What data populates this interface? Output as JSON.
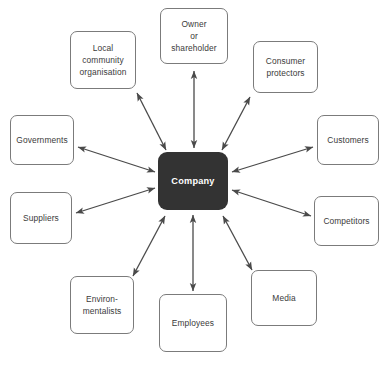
{
  "diagram": {
    "type": "radial-stakeholder-map",
    "hub": {
      "label": "Company",
      "fill": "#333333",
      "text_color": "#ffffff",
      "x": 158,
      "y": 152,
      "width": 70,
      "height": 58
    },
    "node_style": {
      "fill": "#ffffff",
      "border_color": "#7b7b7b",
      "text_color": "#3b3b3b"
    },
    "connector_style": {
      "color": "#4a4a4a",
      "width": 1.3,
      "heads": "both"
    },
    "nodes": [
      {
        "id": "owner",
        "label": "Owner\nor\nshareholder",
        "x": 160,
        "y": 8,
        "width": 68,
        "height": 56,
        "arrow": {
          "x1": 194,
          "y1": 71,
          "x2": 194,
          "y2": 148,
          "heads": "both"
        }
      },
      {
        "id": "local-community-organisation",
        "label": "Local\ncommunity\norganisation",
        "x": 70,
        "y": 31,
        "width": 66,
        "height": 58,
        "arrow": {
          "x1": 137,
          "y1": 93,
          "x2": 166,
          "y2": 150,
          "heads": "both"
        }
      },
      {
        "id": "consumer-protectors",
        "label": "Consumer\nprotectors",
        "x": 253,
        "y": 41,
        "width": 65,
        "height": 52,
        "arrow": {
          "x1": 250,
          "y1": 97,
          "x2": 222,
          "y2": 150,
          "heads": "both"
        }
      },
      {
        "id": "governments",
        "label": "Governments",
        "x": 10,
        "y": 115,
        "width": 64,
        "height": 50,
        "arrow": {
          "x1": 78,
          "y1": 147,
          "x2": 155,
          "y2": 172,
          "heads": "both"
        }
      },
      {
        "id": "customers",
        "label": "Customers",
        "x": 317,
        "y": 115,
        "width": 62,
        "height": 50,
        "arrow": {
          "x1": 313,
          "y1": 147,
          "x2": 232,
          "y2": 172,
          "heads": "both"
        }
      },
      {
        "id": "suppliers",
        "label": "Suppliers",
        "x": 10,
        "y": 192,
        "width": 62,
        "height": 52,
        "arrow": {
          "x1": 76,
          "y1": 213,
          "x2": 155,
          "y2": 188,
          "heads": "both"
        }
      },
      {
        "id": "competitors",
        "label": "Competitors",
        "x": 314,
        "y": 196,
        "width": 65,
        "height": 50,
        "arrow": {
          "x1": 311,
          "y1": 216,
          "x2": 232,
          "y2": 190,
          "heads": "both"
        }
      },
      {
        "id": "environmentalists",
        "label": "Environ-\nmentalists",
        "x": 70,
        "y": 276,
        "width": 64,
        "height": 58,
        "arrow": {
          "x1": 133,
          "y1": 276,
          "x2": 165,
          "y2": 216,
          "heads": "both"
        }
      },
      {
        "id": "employees",
        "label": "Employees",
        "x": 159,
        "y": 294,
        "width": 68,
        "height": 58,
        "arrow": {
          "x1": 193,
          "y1": 291,
          "x2": 193,
          "y2": 215,
          "heads": "both"
        }
      },
      {
        "id": "media",
        "label": "Media",
        "x": 251,
        "y": 270,
        "width": 66,
        "height": 56,
        "arrow": {
          "x1": 252,
          "y1": 270,
          "x2": 223,
          "y2": 216,
          "heads": "both"
        }
      }
    ]
  }
}
